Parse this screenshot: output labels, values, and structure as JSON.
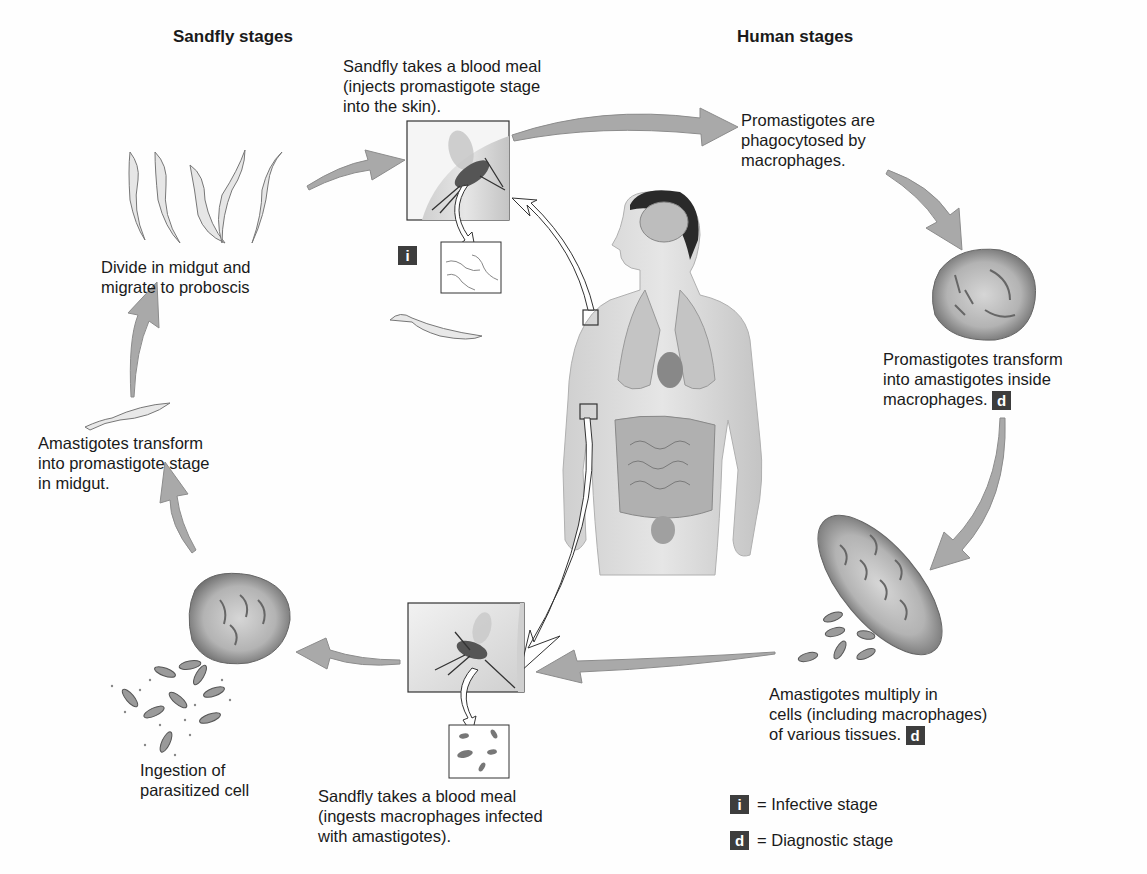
{
  "headings": {
    "sandfly": "Sandfly stages",
    "human": "Human stages"
  },
  "steps": [
    {
      "id": "blood-meal-inject",
      "lines": [
        "Sandfly takes a blood meal",
        "(injects promastigote stage",
        "into the skin)."
      ],
      "badge": "i"
    },
    {
      "id": "phagocytosed",
      "lines": [
        "Promastigotes are",
        "phagocytosed by",
        "macrophages."
      ]
    },
    {
      "id": "transform-amastigotes",
      "lines": [
        "Promastigotes transform",
        "into amastigotes inside",
        "macrophages."
      ],
      "badge": "d"
    },
    {
      "id": "multiply",
      "lines": [
        "Amastigotes multiply in",
        "cells (including macrophages)",
        "of various tissues."
      ],
      "badge": "d"
    },
    {
      "id": "blood-meal-ingest",
      "lines": [
        "Sandfly takes a blood meal",
        "(ingests macrophages infected",
        "with amastigotes)."
      ]
    },
    {
      "id": "ingestion",
      "lines": [
        "Ingestion of",
        "parasitized cell"
      ]
    },
    {
      "id": "transform-promastigote",
      "lines": [
        "Amastigotes transform",
        "into promastigote stage",
        "in midgut."
      ]
    },
    {
      "id": "divide",
      "lines": [
        "Divide in midgut and",
        "migrate to proboscis"
      ]
    }
  ],
  "legend": [
    {
      "badge": "i",
      "text": "= Infective stage"
    },
    {
      "badge": "d",
      "text": "= Diagnostic stage"
    }
  ],
  "colors": {
    "arrow_fill": "#a9a9a9",
    "arrow_stroke": "#8c8c8c",
    "badge_bg": "#3d3d3d",
    "cell_fill": "#9a9a9a",
    "skin": "#d8d8d8"
  }
}
